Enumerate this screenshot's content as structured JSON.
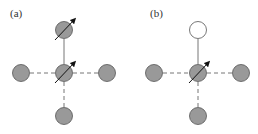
{
  "panels": [
    {
      "label": "(a)",
      "top_site": "spin-filled",
      "center_site": "spin-filled",
      "neighbors": [
        "left",
        "right",
        "bottom"
      ]
    },
    {
      "label": "(b)",
      "top_site": "empty",
      "center_site": "spin-filled",
      "neighbors": [
        "left",
        "right",
        "bottom"
      ]
    }
  ],
  "colors": {
    "site_fill": "#999999",
    "site_stroke": "#555555",
    "empty_fill": "#ffffff",
    "bond": "#777777"
  }
}
